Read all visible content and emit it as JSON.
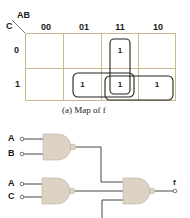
{
  "kmap": {
    "corner_row_var": "C",
    "corner_col_var": "AB",
    "col_headers": [
      "00",
      "01",
      "11",
      "10"
    ],
    "row_headers": [
      "0",
      "1"
    ],
    "cells": [
      [
        "",
        "",
        "1",
        ""
      ],
      [
        "",
        "1",
        "1",
        "1"
      ]
    ],
    "groups": [
      {
        "name": "AB",
        "cells": [
          [
            0,
            2
          ],
          [
            1,
            2
          ]
        ]
      },
      {
        "name": "BC",
        "cells": [
          [
            1,
            1
          ],
          [
            1,
            2
          ]
        ]
      },
      {
        "name": "AC",
        "cells": [
          [
            1,
            2
          ],
          [
            1,
            3
          ]
        ]
      }
    ],
    "caption": "(a) Map of f",
    "grid_color": "#c9b98f"
  },
  "circuit": {
    "gate1": {
      "type": "NAND",
      "inputs": [
        "A",
        "B"
      ]
    },
    "gate2": {
      "type": "NAND",
      "inputs": [
        "A",
        "C"
      ]
    },
    "gate3": {
      "type": "NAND",
      "inputs": [
        "gate1",
        "gate2",
        "gate_hidden"
      ]
    },
    "output": "f",
    "gate_fill": "#ddd3c4"
  }
}
